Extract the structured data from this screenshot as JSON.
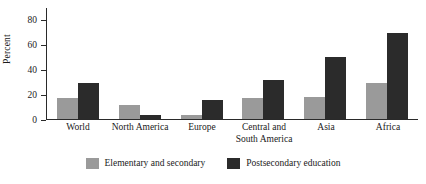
{
  "chart_data": {
    "type": "bar",
    "title": "",
    "subtitle": "",
    "xlabel": "",
    "ylabel": "Percent",
    "ylim": [
      0,
      90
    ],
    "yticks": [
      0,
      20,
      40,
      60,
      80
    ],
    "grid": false,
    "legend_position": "bottom-center",
    "categories": [
      "World",
      "North America",
      "Europe",
      "Central and\nSouth America",
      "Asia",
      "Africa"
    ],
    "series": [
      {
        "name": "Elementary and secondary",
        "color": "#9a9a9a",
        "values": [
          17,
          11,
          3,
          17,
          18,
          29
        ]
      },
      {
        "name": "Postsecondary education",
        "color": "#2b2b2b",
        "values": [
          29,
          3,
          15,
          31,
          50,
          69
        ]
      }
    ]
  },
  "axis": {
    "y_title": "Percent"
  },
  "colors": {
    "series_elementary": "#9a9a9a",
    "series_postsecondary": "#2b2b2b",
    "axis": "#2a2a2a",
    "background": "#ffffff"
  }
}
